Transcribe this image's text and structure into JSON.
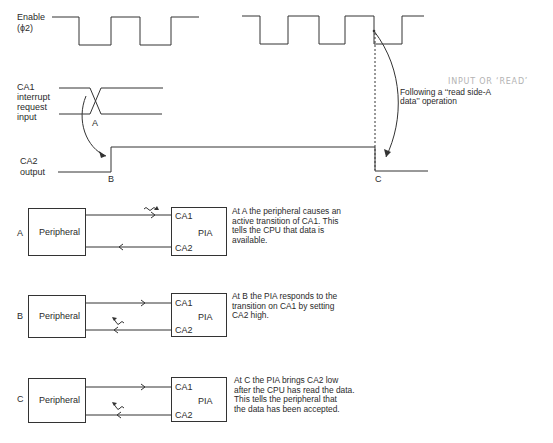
{
  "timing": {
    "enable_label_line1": "Enable",
    "enable_label_line2": "(ϕ2)",
    "ca1_label_line1": "CA1",
    "ca1_label_line2": "interrupt",
    "ca1_label_line3": "request",
    "ca1_label_line4": "input",
    "ca2_label_line1": "CA2",
    "ca2_label_line2": "output",
    "point_a": "A",
    "point_b": "B",
    "point_c": "C",
    "annotation_line1": "Following a ‘‘read side-A",
    "annotation_line2": "data’’ operation",
    "handwritten_note": "INPUT OR ‘READ’"
  },
  "diagrams": [
    {
      "label": "A",
      "peripheral": "Peripheral",
      "pia": "PIA",
      "pin1": "CA1",
      "pin2": "CA2",
      "description": [
        "At A the peripheral causes an",
        "active transition of CA1. This",
        "tells the CPU that data is",
        "available."
      ]
    },
    {
      "label": "B",
      "peripheral": "Peripheral",
      "pia": "PIA",
      "pin1": "CA1",
      "pin2": "CA2",
      "description": [
        "At B the PIA responds to the",
        "transition on CA1 by setting",
        "CA2 high."
      ]
    },
    {
      "label": "C",
      "peripheral": "Peripheral",
      "pia": "PIA",
      "pin1": "CA1",
      "pin2": "CA2",
      "description": [
        "At C the PIA brings CA2 low",
        "after the CPU has read the data.",
        "This tells the peripheral that",
        "the data has been accepted."
      ]
    }
  ],
  "colors": {
    "line": "#333333",
    "text": "#2a2a2a",
    "handwriting": "#b3b3b3"
  }
}
